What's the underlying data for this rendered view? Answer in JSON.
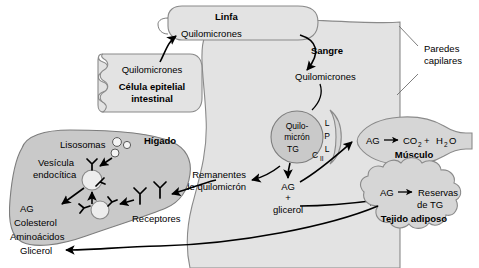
{
  "diagram": {
    "colors": {
      "organ_light": "#e3e3e3",
      "organ_mid": "#d6d6d6",
      "organ_dark": "#c9c9c9",
      "outline": "#8a8a8a",
      "arrow": "#000000"
    }
  },
  "lymph": {
    "title": "Linfa",
    "content": "Quilomicrones"
  },
  "intestinal_cell": {
    "content": "Quilomicrones",
    "title_line1": "Célula epitelial",
    "title_line2": "intestinal"
  },
  "blood": {
    "title": "Sangre",
    "chylomicrons": "Quilomicrones",
    "capillary_walls_line1": "Paredes",
    "capillary_walls_line2": "capilares",
    "remnants_line1": "Remanentes",
    "remnants_line2": "de quilomicrón",
    "products_line1": "AG",
    "products_line2": "+",
    "products_line3": "glicerol"
  },
  "chylomicron_particle": {
    "name_line1": "Quilo-",
    "name_line2": "micrón",
    "cargo": "TG",
    "apoprotein": "C",
    "apoprotein_sub": "II"
  },
  "lpl": {
    "letter1": "L",
    "letter2": "P",
    "letter3": "L"
  },
  "muscle": {
    "substrate": "AG",
    "product_c": "CO",
    "product_c_sub": "2",
    "plus": "+",
    "product_h": "H",
    "product_h_sub": "2",
    "product_o": "O",
    "title": "Músculo"
  },
  "adipose": {
    "substrate": "AG",
    "product_line1": "Reservas",
    "product_line2": "de TG",
    "title": "Tejido adiposo"
  },
  "liver": {
    "title": "Hígado",
    "lysosomes": "Lisosomas",
    "vesicle_line1": "Vesícula",
    "vesicle_line2": "endocítica",
    "receptors": "Receptores",
    "products": [
      "AG",
      "Colesterol",
      "Aminoácidos",
      "Glicerol"
    ]
  }
}
